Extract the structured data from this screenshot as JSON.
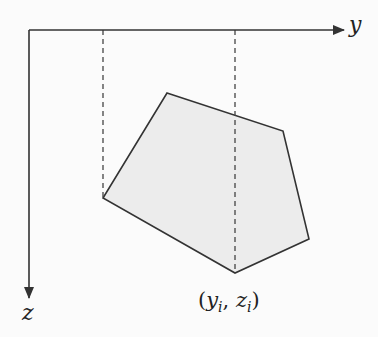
{
  "diagram": {
    "axes": {
      "horizontal_label": "y",
      "vertical_label": "z",
      "origin": [
        29,
        30
      ],
      "horizontal_end": [
        344,
        30
      ],
      "vertical_end": [
        29,
        298
      ]
    },
    "polygon": {
      "fill": "#ececec",
      "stroke": "#333333",
      "vertices": [
        [
          167,
          93
        ],
        [
          283,
          131
        ],
        [
          309,
          239
        ],
        [
          235,
          273
        ],
        [
          103,
          198
        ]
      ]
    },
    "projection_lines": [
      {
        "x": 103,
        "y_top": 30,
        "y_bottom": 198
      },
      {
        "x": 235,
        "y_top": 30,
        "y_bottom": 273
      }
    ],
    "vertex_label": {
      "open": "(",
      "y_var": "y",
      "y_sub": "i",
      "sep": ", ",
      "z_var": "z",
      "z_sub": "i",
      "close": ")"
    }
  }
}
